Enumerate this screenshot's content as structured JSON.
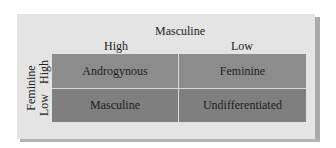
{
  "diagram": {
    "type": "2x2 matrix",
    "column_axis": {
      "title": "Masculine",
      "labels": [
        "High",
        "Low"
      ]
    },
    "row_axis": {
      "title": "Feminine",
      "labels": [
        "High",
        "Low"
      ]
    },
    "cells": [
      [
        "Androgynous",
        "Feminine"
      ],
      [
        "Masculine",
        "Undifferentiated"
      ]
    ],
    "colors": {
      "panel": "#e4e4e4",
      "top_row": "#8c8c8c",
      "bottom_row": "#7f7f7f",
      "divider": "#d8d8d8",
      "shadow": "#a9a9a9"
    }
  }
}
